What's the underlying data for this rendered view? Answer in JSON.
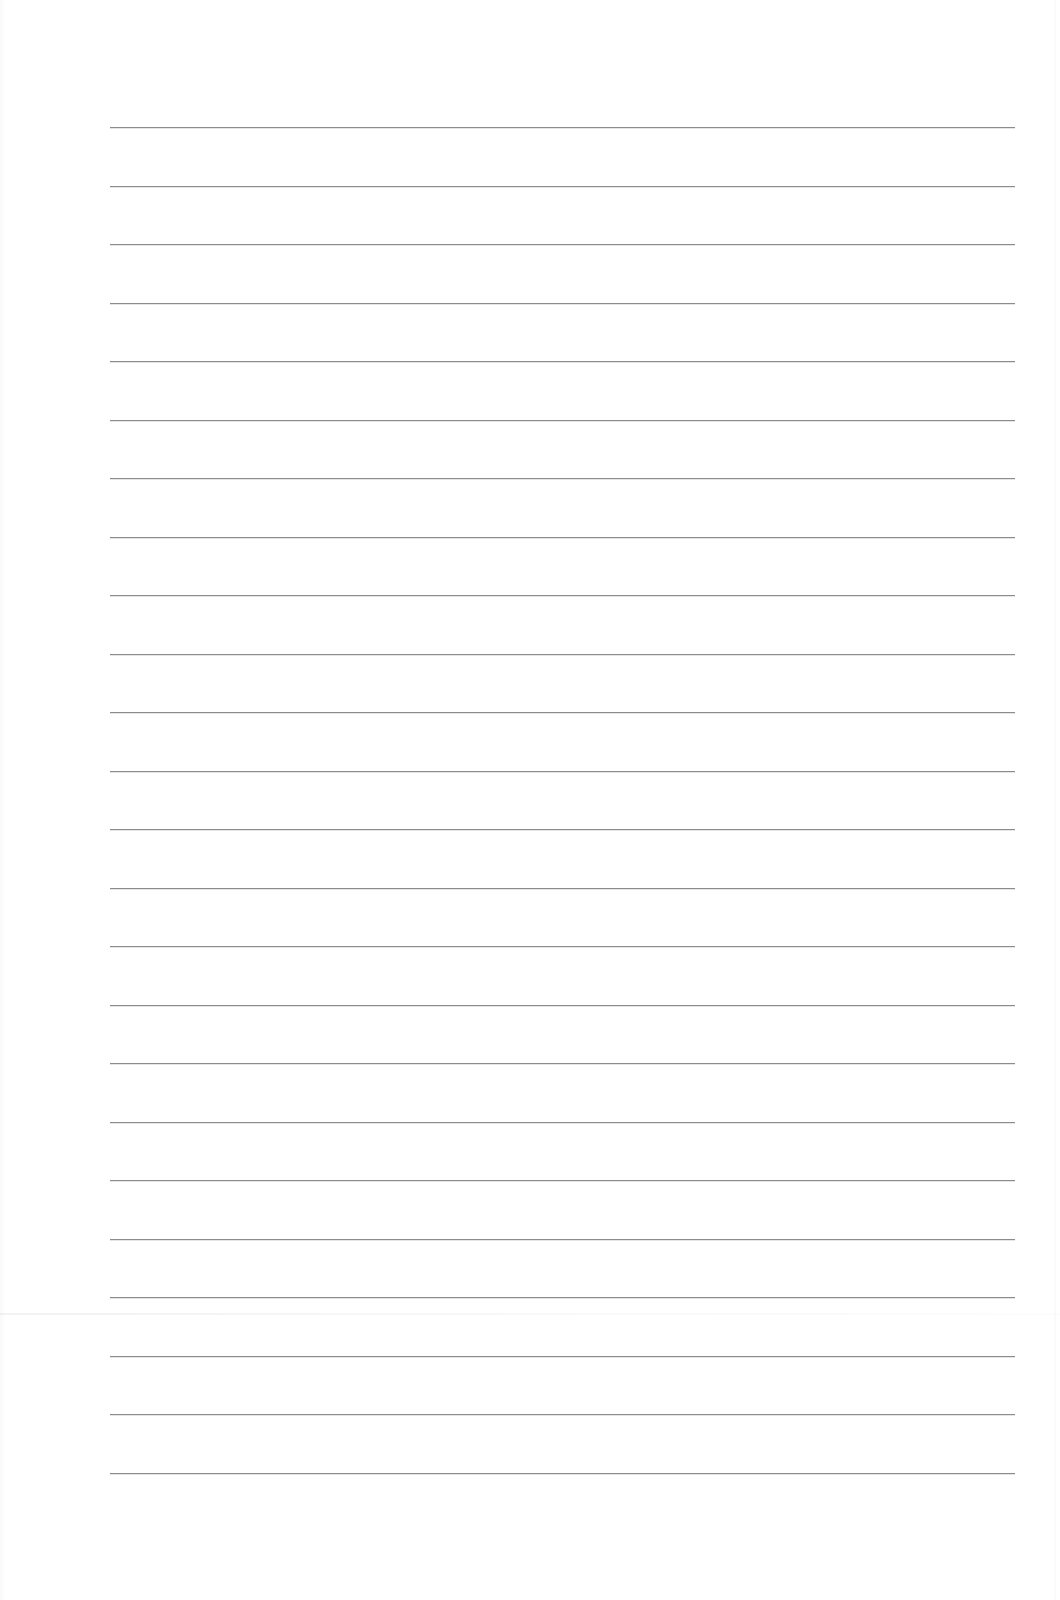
{
  "document": {
    "type": "blank lined paper",
    "background_color": "#ffffff",
    "rule_color": "#8c8c8c",
    "rule_count": 24,
    "rule_left_px": 110,
    "rule_right_px": 1015,
    "first_rule_top_px": 127,
    "rule_spacing_px": 58.5,
    "text": ""
  }
}
